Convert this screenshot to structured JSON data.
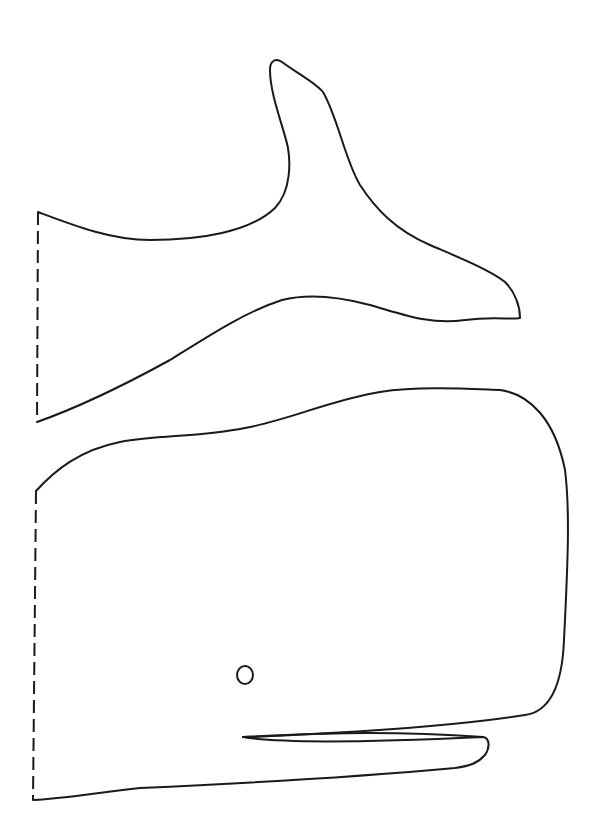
{
  "page": {
    "title": "Whale cutout template",
    "background": "#ffffff",
    "line_color": "#1a1a1a"
  },
  "pieces": [
    {
      "id": "tail",
      "label": "Whale tail piece",
      "fold_edge": "dashed left edge",
      "fold_line": {
        "x1": 38,
        "y1": 212,
        "x2": 37,
        "y2": 422
      },
      "outline_path": "M38,212 C70,224 110,240 150,240 C200,240 250,232 275,208 C292,190 290,160 288,148 C284,128 270,95 270,70 C270,60 276,58 282,62 C295,72 315,82 323,92 C338,118 345,160 360,185 C375,208 395,230 430,245 C460,258 490,270 505,282 C515,292 520,306 520,318 C510,320 495,316 465,320 C430,325 405,315 370,305 C340,297 310,293 282,300 C245,312 210,335 170,360 C130,382 85,405 37,422"
    },
    {
      "id": "body",
      "label": "Whale body piece",
      "fold_edge": "dashed left edge",
      "fold_line": {
        "x1": 36,
        "y1": 491,
        "x2": 33,
        "y2": 800
      },
      "outline_path": "M36,491 C55,470 80,450 120,442 C160,435 200,437 245,428 C290,420 330,400 380,392 C420,386 470,389 500,390 C530,394 555,420 565,470 C570,510 568,560 564,640 C562,690 548,712 525,715 C480,722 420,728 330,733 C290,735 260,737 243,737 C270,742 330,744 483,737 C490,738 490,748 485,755 C478,763 470,766 455,768 C400,773 300,781 140,788 C100,792 70,798 33,800"
    }
  ],
  "details": {
    "eye": {
      "cx": 245,
      "cy": 675,
      "rx": 8,
      "ry": 9
    },
    "mouth_line": "M243,737 C300,734 380,730 483,737"
  },
  "annotations": {
    "fold_line_legend": "dashed line = fold / attach edge"
  }
}
